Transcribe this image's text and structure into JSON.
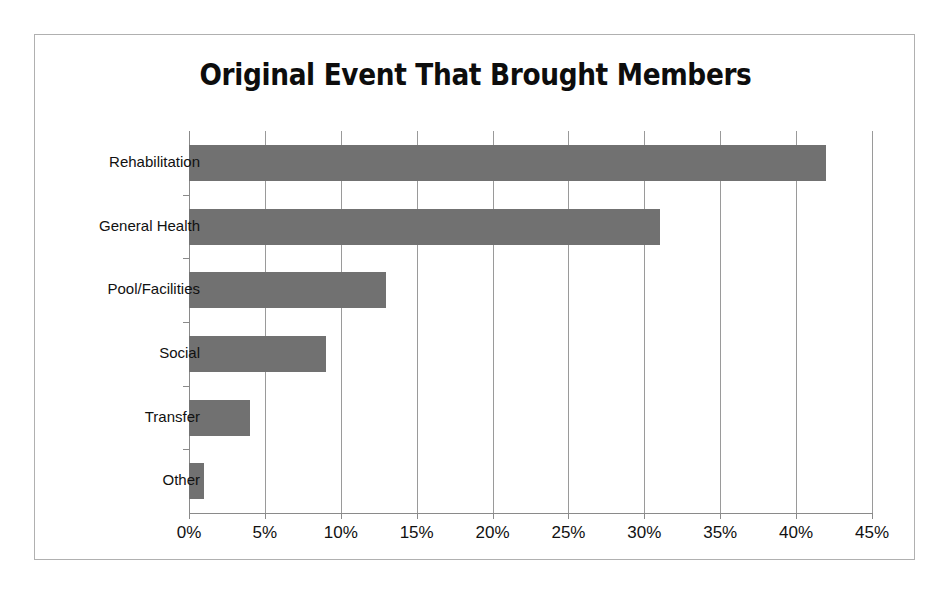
{
  "chart_data": {
    "type": "bar",
    "orientation": "horizontal",
    "title": "Original Event That Brought Members",
    "xlabel": "",
    "ylabel": "",
    "categories": [
      "Rehabilitation",
      "General Health",
      "Pool/Facilities",
      "Social",
      "Transfer",
      "Other"
    ],
    "values": [
      42,
      31,
      13,
      9,
      4,
      1
    ],
    "value_unit": "%",
    "xlim": [
      0,
      45
    ],
    "xticks": [
      0,
      5,
      10,
      15,
      20,
      25,
      30,
      35,
      40,
      45
    ],
    "xtick_labels": [
      "0%",
      "5%",
      "10%",
      "15%",
      "20%",
      "25%",
      "30%",
      "35%",
      "40%",
      "45%"
    ],
    "grid": "vertical",
    "legend": "none",
    "series": [
      {
        "name": "Original Event That Brought Members",
        "values": [
          42,
          31,
          13,
          9,
          4,
          1
        ]
      }
    ],
    "colors": {
      "bar": "#717171",
      "gridline": "#9a9a9a",
      "axis": "#8a8a8a",
      "frame_border": "#b0b0b0",
      "title_text": "#0d0d0d",
      "tick_text": "#111111",
      "background": "#ffffff"
    }
  }
}
